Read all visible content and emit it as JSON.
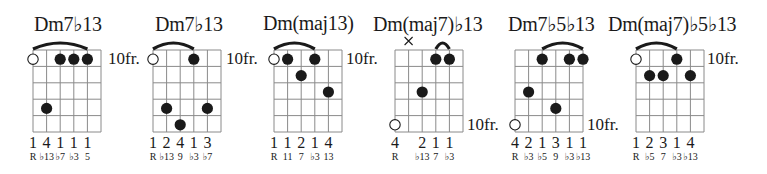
{
  "colors": {
    "ink": "#1a1a1a",
    "grid": "#8a8a8a",
    "background": "#ffffff"
  },
  "chords": [
    {
      "name": "Dm7♭13",
      "fret_label": "10fr.",
      "fret_label_row": 1,
      "muted": [],
      "open_circles": [
        {
          "string": 1,
          "row": 1
        }
      ],
      "dots": [
        {
          "string": 3,
          "row": 1
        },
        {
          "string": 4,
          "row": 1
        },
        {
          "string": 5,
          "row": 1
        },
        {
          "string": 2,
          "row": 4
        }
      ],
      "barre": {
        "from": 1,
        "to": 5
      },
      "fingers": [
        "1",
        "4",
        "1",
        "1",
        "1",
        ""
      ],
      "intervals": [
        "R",
        "♭13",
        "♭7",
        "♭3",
        "5",
        ""
      ]
    },
    {
      "name": "Dm7♭13",
      "fret_label": "10fr.",
      "fret_label_row": 1,
      "muted": [],
      "open_circles": [
        {
          "string": 1,
          "row": 1
        }
      ],
      "dots": [
        {
          "string": 4,
          "row": 1
        },
        {
          "string": 2,
          "row": 4
        },
        {
          "string": 5,
          "row": 4
        },
        {
          "string": 3,
          "row": 5
        }
      ],
      "barre": {
        "from": 1,
        "to": 4
      },
      "fingers": [
        "1",
        "2",
        "4",
        "1",
        "3",
        ""
      ],
      "intervals": [
        "R",
        "♭13",
        "9",
        "♭3",
        "♭7",
        ""
      ]
    },
    {
      "name": "Dm(maj13)",
      "fret_label": "10fr.",
      "fret_label_row": 1,
      "muted": [],
      "open_circles": [
        {
          "string": 1,
          "row": 1
        }
      ],
      "dots": [
        {
          "string": 2,
          "row": 1
        },
        {
          "string": 4,
          "row": 1
        },
        {
          "string": 3,
          "row": 2
        },
        {
          "string": 5,
          "row": 3
        }
      ],
      "barre": {
        "from": 1,
        "to": 4
      },
      "fingers": [
        "1",
        "1",
        "2",
        "1",
        "4",
        ""
      ],
      "intervals": [
        "R",
        "11",
        "7",
        "♭3",
        "13",
        ""
      ]
    },
    {
      "name": "Dm(maj7)♭13",
      "fret_label": "10fr.",
      "fret_label_row": 5,
      "muted": [
        {
          "string": 2
        }
      ],
      "open_circles": [
        {
          "string": 1,
          "row": 5
        }
      ],
      "dots": [
        {
          "string": 4,
          "row": 1
        },
        {
          "string": 5,
          "row": 1
        },
        {
          "string": 3,
          "row": 3
        }
      ],
      "barre": {
        "from": 4,
        "to": 5
      },
      "fingers": [
        "4",
        "",
        "2",
        "1",
        "1",
        ""
      ],
      "intervals": [
        "R",
        "",
        "♭13",
        "7",
        "♭3",
        ""
      ]
    },
    {
      "name": "Dm7♭5♭13",
      "fret_label": "10fr.",
      "fret_label_row": 5,
      "muted": [],
      "open_circles": [
        {
          "string": 1,
          "row": 5
        }
      ],
      "dots": [
        {
          "string": 3,
          "row": 1
        },
        {
          "string": 5,
          "row": 1
        },
        {
          "string": 6,
          "row": 1
        },
        {
          "string": 2,
          "row": 3
        },
        {
          "string": 4,
          "row": 4
        }
      ],
      "barre": {
        "from": 3,
        "to": 6
      },
      "fingers": [
        "4",
        "2",
        "1",
        "3",
        "1",
        "1"
      ],
      "intervals": [
        "R",
        "♭3",
        "♭5",
        "9",
        "♭3",
        "♭13"
      ]
    },
    {
      "name": "Dm(maj7)♭5♭13",
      "fret_label": "10fr.",
      "fret_label_row": 1,
      "muted": [],
      "open_circles": [
        {
          "string": 1,
          "row": 1
        }
      ],
      "dots": [
        {
          "string": 4,
          "row": 1
        },
        {
          "string": 2,
          "row": 2
        },
        {
          "string": 3,
          "row": 2
        },
        {
          "string": 5,
          "row": 2
        }
      ],
      "barre": {
        "from": 1,
        "to": 4
      },
      "fingers": [
        "1",
        "2",
        "3",
        "1",
        "4",
        ""
      ],
      "intervals": [
        "R",
        "♭5",
        "7",
        "♭3",
        "♭13",
        ""
      ]
    }
  ]
}
